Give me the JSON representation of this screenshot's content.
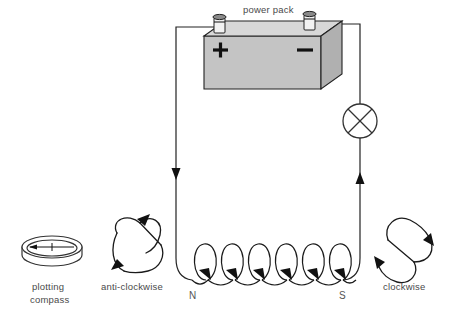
{
  "diagram": {
    "labels": {
      "power_pack": "power pack",
      "plotting_compass_line1": "plotting",
      "plotting_compass_line2": "compass",
      "anti_clockwise": "anti-clockwise",
      "clockwise": "clockwise",
      "pole_north": "N",
      "pole_south": "S",
      "terminal_positive": "+",
      "terminal_negative": "−"
    },
    "colors": {
      "stroke": "#222222",
      "box_top": "#d8d8d8",
      "box_front": "#c4c4c4",
      "box_side": "#b0b0b0",
      "text": "#4a4a4a",
      "background": "#ffffff"
    },
    "components": {
      "power_pack": {
        "name": "power pack",
        "type": "dc-supply",
        "terminals": [
          "+",
          "-"
        ]
      },
      "lamp": {
        "name": "lamp",
        "type": "circuit-lamp-symbol"
      },
      "solenoid": {
        "name": "solenoid coil",
        "turns": 6,
        "north_end": "N",
        "south_end": "S"
      },
      "compass": {
        "name": "plotting compass",
        "needle_direction": "left"
      }
    },
    "current_arrows": {
      "left_wire": "down",
      "right_wire": "up",
      "coil": "down-right"
    }
  }
}
